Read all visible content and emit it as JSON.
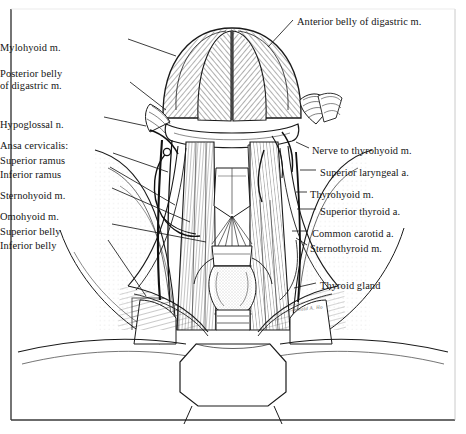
{
  "figure": {
    "style": "pen-and-ink anatomical line engraving",
    "frame_color": "#2b2b2b",
    "background": "#ffffff",
    "ink_color": "#1a1a1a",
    "signature": "Ronald A. Ho"
  },
  "labels_left": [
    {
      "id": "mylohyoid",
      "lines": [
        "Mylohyoid m."
      ],
      "x": 52,
      "y": 42
    },
    {
      "id": "posterior-digastric",
      "lines": [
        "Posterior belly",
        "of digastric m."
      ],
      "x": 46,
      "y": 68
    },
    {
      "id": "hypoglossal",
      "lines": [
        "Hypoglossal n."
      ],
      "x": 14,
      "y": 119
    },
    {
      "id": "ansa-cervicalis",
      "lines": [
        "Ansa cervicalis:"
      ],
      "x": 14,
      "y": 140
    },
    {
      "id": "superior-ramus",
      "lines": [
        "Superior ramus"
      ],
      "x": 34,
      "y": 155
    },
    {
      "id": "inferior-ramus",
      "lines": [
        "Inferior ramus"
      ],
      "x": 34,
      "y": 169
    },
    {
      "id": "sternohyoid",
      "lines": [
        "Sternohyoid m."
      ],
      "x": 20,
      "y": 190
    },
    {
      "id": "omohyoid",
      "lines": [
        "Omohyoid m."
      ],
      "x": 14,
      "y": 211
    },
    {
      "id": "superior-belly",
      "lines": [
        "Superior belly"
      ],
      "x": 31,
      "y": 226
    },
    {
      "id": "inferior-belly",
      "lines": [
        "Inferior belly"
      ],
      "x": 31,
      "y": 240
    }
  ],
  "labels_right": [
    {
      "id": "anterior-digastric",
      "lines": [
        "Anterior belly of digastric m."
      ],
      "x": 297,
      "y": 16
    },
    {
      "id": "nerve-to-thyrohyoid",
      "lines": [
        "Nerve to thyrohyoid m."
      ],
      "x": 312,
      "y": 145
    },
    {
      "id": "superior-laryngeal",
      "lines": [
        "Superior laryngeal a."
      ],
      "x": 320,
      "y": 167
    },
    {
      "id": "thyrohyoid",
      "lines": [
        "Thyrohyoid m."
      ],
      "x": 310,
      "y": 189
    },
    {
      "id": "superior-thyroid",
      "lines": [
        "Superior thyroid a."
      ],
      "x": 320,
      "y": 206
    },
    {
      "id": "common-carotid",
      "lines": [
        "Common carotid a."
      ],
      "x": 312,
      "y": 228
    },
    {
      "id": "sternothyroid",
      "lines": [
        "Sternothyroid m."
      ],
      "x": 310,
      "y": 243
    },
    {
      "id": "thyroid-gland",
      "lines": [
        "Thyroid gland"
      ],
      "x": 320,
      "y": 280
    }
  ]
}
